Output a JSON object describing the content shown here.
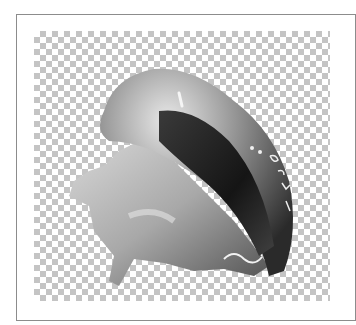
{
  "image": {
    "subject": "conch shell",
    "background": "transparency checkerboard",
    "colors": {
      "frame_border": "#8c8c8c",
      "checker_dark": "#c4c4c4",
      "checker_light": "#ffffff"
    }
  }
}
